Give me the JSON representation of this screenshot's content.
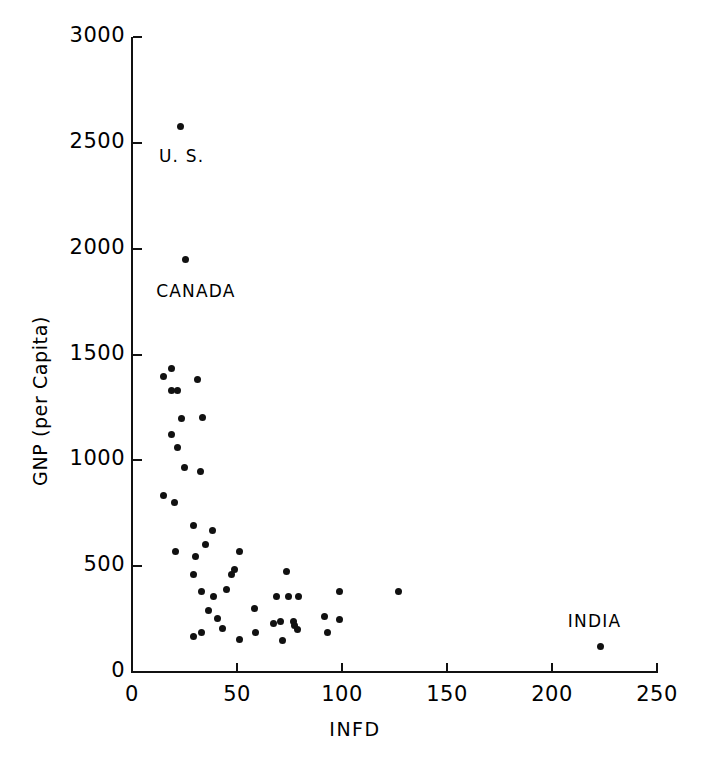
{
  "chart_data": {
    "type": "scatter",
    "title": "",
    "subtitle": "",
    "xlabel": "INFD",
    "ylabel": "GNP (per Capita)",
    "xlim": [
      0,
      250
    ],
    "ylim": [
      0,
      3000
    ],
    "xticks": [
      0,
      50,
      100,
      150,
      200,
      250
    ],
    "xtick_labels": [
      "0",
      "50",
      "100",
      "150",
      "200",
      "250"
    ],
    "yticks": [
      0,
      500,
      1000,
      1500,
      2000,
      2500,
      3000
    ],
    "ytick_labels": [
      "0",
      "500",
      "1000",
      "1500",
      "2000",
      "2500",
      "3000"
    ],
    "grid": false,
    "legend": "none",
    "marker": "filled-circle",
    "marker_color": "#111111",
    "background_color": "#ffffff",
    "points": [
      {
        "x": 23.3,
        "y": 2575,
        "label": "U.S."
      },
      {
        "x": 25.7,
        "y": 1947,
        "label": "CANADA"
      },
      {
        "x": 223.3,
        "y": 120,
        "label": "INDIA"
      },
      {
        "x": 19.0,
        "y": 1435
      },
      {
        "x": 15.2,
        "y": 1397
      },
      {
        "x": 31.4,
        "y": 1382
      },
      {
        "x": 18.6,
        "y": 1330
      },
      {
        "x": 21.9,
        "y": 1330
      },
      {
        "x": 23.8,
        "y": 1200
      },
      {
        "x": 33.8,
        "y": 1204
      },
      {
        "x": 18.6,
        "y": 1122
      },
      {
        "x": 21.9,
        "y": 1060
      },
      {
        "x": 25.2,
        "y": 965
      },
      {
        "x": 32.4,
        "y": 945
      },
      {
        "x": 14.8,
        "y": 835
      },
      {
        "x": 20.0,
        "y": 800
      },
      {
        "x": 29.5,
        "y": 690
      },
      {
        "x": 38.1,
        "y": 670
      },
      {
        "x": 34.8,
        "y": 602
      },
      {
        "x": 20.5,
        "y": 570
      },
      {
        "x": 30.0,
        "y": 545
      },
      {
        "x": 51.4,
        "y": 570
      },
      {
        "x": 48.6,
        "y": 485
      },
      {
        "x": 47.6,
        "y": 460
      },
      {
        "x": 29.5,
        "y": 460
      },
      {
        "x": 32.9,
        "y": 380
      },
      {
        "x": 44.8,
        "y": 390
      },
      {
        "x": 38.6,
        "y": 355
      },
      {
        "x": 73.8,
        "y": 475
      },
      {
        "x": 69.0,
        "y": 355
      },
      {
        "x": 74.3,
        "y": 355
      },
      {
        "x": 79.5,
        "y": 355
      },
      {
        "x": 58.1,
        "y": 300
      },
      {
        "x": 67.6,
        "y": 230
      },
      {
        "x": 70.5,
        "y": 240
      },
      {
        "x": 76.7,
        "y": 240
      },
      {
        "x": 77.6,
        "y": 220
      },
      {
        "x": 79.0,
        "y": 200
      },
      {
        "x": 99.0,
        "y": 250
      },
      {
        "x": 92.9,
        "y": 185
      },
      {
        "x": 71.9,
        "y": 150
      },
      {
        "x": 58.6,
        "y": 185
      },
      {
        "x": 99.0,
        "y": 380
      },
      {
        "x": 91.9,
        "y": 260
      },
      {
        "x": 127.1,
        "y": 380
      },
      {
        "x": 29.5,
        "y": 170
      },
      {
        "x": 51.0,
        "y": 155
      },
      {
        "x": 33.3,
        "y": 185
      },
      {
        "x": 43.3,
        "y": 205
      },
      {
        "x": 40.5,
        "y": 255
      },
      {
        "x": 36.2,
        "y": 290
      }
    ],
    "annotations": [
      {
        "text": "U. S.",
        "x": 23.3,
        "y": 2440
      },
      {
        "text": "CANADA",
        "x": 22.0,
        "y": 1800
      },
      {
        "text": "INDIA",
        "x": 218.0,
        "y": 240
      }
    ]
  },
  "axes": {
    "x_title": "INFD",
    "y_title": "GNP (per Capita)"
  }
}
